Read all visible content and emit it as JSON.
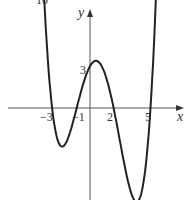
{
  "chart_data": {
    "type": "line",
    "title": "",
    "xlabel": "x",
    "ylabel": "y",
    "function": "y = 0.1(x+3)(x+1)(x-2)(x-5)",
    "roots": [
      -3,
      -1,
      2,
      5
    ],
    "y_intercept": 3,
    "x_tick_labels": [
      "-3",
      "-1",
      "2",
      "5"
    ],
    "y_tick_labels": [
      "3"
    ],
    "top_label": "10",
    "xlim": [
      -7.2,
      7.9
    ],
    "ylim": [
      -9.5,
      8
    ],
    "grid": false,
    "legend": null
  },
  "labels": {
    "top": "10",
    "y_axis": "y",
    "x_axis": "x",
    "y3": "3",
    "xm3": "−3",
    "xm1": "−1",
    "x2": "2",
    "x5": "5"
  }
}
